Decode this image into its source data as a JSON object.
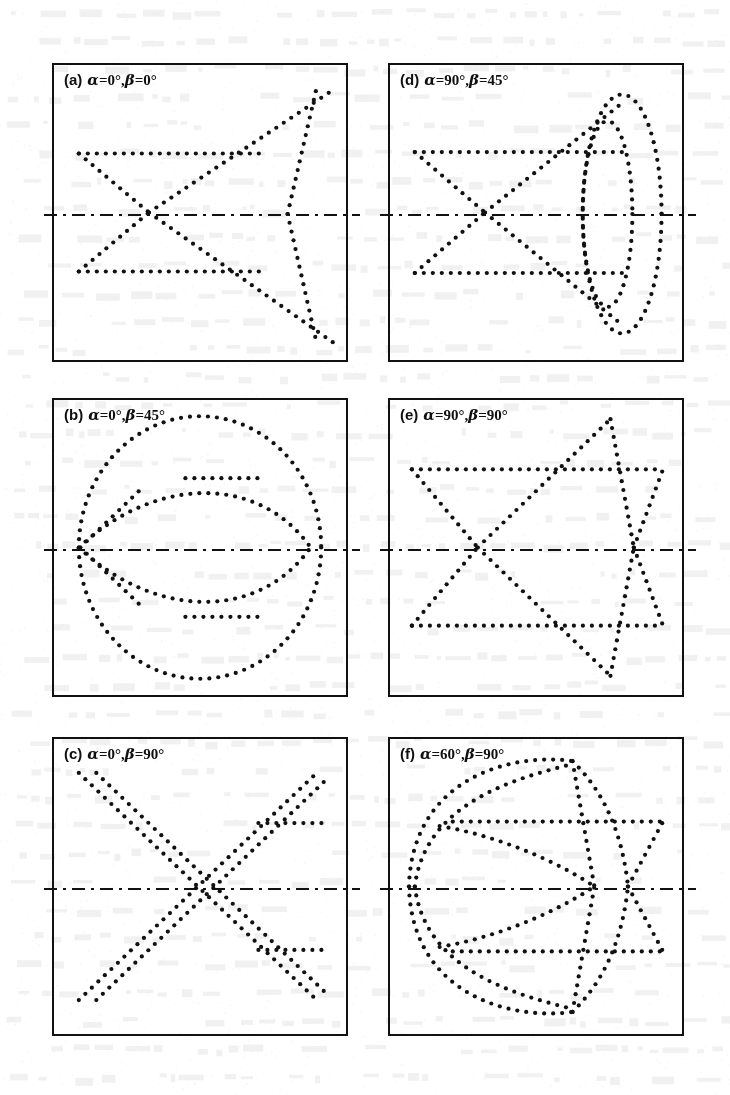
{
  "figure": {
    "kind": "six-panel-dot-pattern-figure",
    "panel_count": 6,
    "background_note": "faint bleed-through of printed text from the reverse of the scanned page",
    "ink_color": "#111111",
    "paper_color": "#ffffff",
    "dot_color": "#111111",
    "dot_diameter_px": 4.2,
    "dot_spacing_px": 9,
    "centerline_style": "dash-dot",
    "layout": {
      "columns": 2,
      "rows": 3,
      "panel_width_px": 296,
      "panel_height_px": 299,
      "col_x_px": [
        52,
        388
      ],
      "row_y_px": [
        63,
        398,
        737
      ]
    }
  },
  "panels": [
    {
      "id": "a",
      "tag": "(a)",
      "alpha": "0°",
      "beta": "0°",
      "params_text": "α=0°,β=0°",
      "centerline_y_frac": 0.5,
      "chart_data": {
        "type": "scatter",
        "title": "(a) α=0°, β=0°",
        "xlim": [
          0,
          1
        ],
        "ylim": [
          0,
          1
        ],
        "grid": false,
        "legend": null,
        "strokes": [
          {
            "name": "upper-horizontal",
            "kind": "line",
            "points": [
              [
                0.085,
                0.3
              ],
              [
                0.72,
                0.3
              ]
            ]
          },
          {
            "name": "lower-horizontal",
            "kind": "line",
            "points": [
              [
                0.085,
                0.7
              ],
              [
                0.72,
                0.7
              ]
            ]
          },
          {
            "name": "upper-left-diagonal-down",
            "kind": "line",
            "points": [
              [
                0.085,
                0.3
              ],
              [
                0.325,
                0.5
              ]
            ]
          },
          {
            "name": "lower-left-diagonal-up",
            "kind": "line",
            "points": [
              [
                0.085,
                0.7
              ],
              [
                0.325,
                0.5
              ]
            ]
          },
          {
            "name": "left-node-to-upper-right",
            "kind": "line",
            "points": [
              [
                0.325,
                0.5
              ],
              [
                0.955,
                0.085
              ]
            ]
          },
          {
            "name": "left-node-to-lower-right",
            "kind": "line",
            "points": [
              [
                0.325,
                0.5
              ],
              [
                0.955,
                0.94
              ]
            ]
          },
          {
            "name": "right-node-steep-up",
            "kind": "line",
            "points": [
              [
                0.8,
                0.505
              ],
              [
                0.9,
                0.075
              ]
            ]
          },
          {
            "name": "right-node-steep-down",
            "kind": "line",
            "points": [
              [
                0.8,
                0.505
              ],
              [
                0.9,
                0.945
              ]
            ]
          }
        ]
      }
    },
    {
      "id": "b",
      "tag": "(b)",
      "alpha": "0°",
      "beta": "45°",
      "params_text": "α=0°,β=45°",
      "centerline_y_frac": 0.5,
      "chart_data": {
        "type": "scatter",
        "title": "(b) α=0°, β=45°",
        "xlim": [
          0,
          1
        ],
        "ylim": [
          0,
          1
        ],
        "grid": false,
        "legend": null,
        "strokes": [
          {
            "name": "outer-circle",
            "kind": "ellipse",
            "cx": 0.5,
            "cy": 0.5,
            "rx": 0.415,
            "ry": 0.445,
            "a0": 0,
            "a1": 360
          },
          {
            "name": "inner-lens-upper",
            "kind": "arc-bezier",
            "points": [
              [
                0.085,
                0.5
              ],
              [
                0.35,
                0.255
              ],
              [
                0.7,
                0.255
              ],
              [
                0.875,
                0.495
              ]
            ]
          },
          {
            "name": "inner-lens-lower",
            "kind": "arc-bezier",
            "points": [
              [
                0.085,
                0.5
              ],
              [
                0.35,
                0.745
              ],
              [
                0.7,
                0.745
              ],
              [
                0.875,
                0.505
              ]
            ]
          },
          {
            "name": "inner-horizontal-upper",
            "kind": "line",
            "points": [
              [
                0.45,
                0.265
              ],
              [
                0.7,
                0.265
              ]
            ]
          },
          {
            "name": "inner-horizontal-lower",
            "kind": "line",
            "points": [
              [
                0.45,
                0.735
              ],
              [
                0.7,
                0.735
              ]
            ]
          },
          {
            "name": "left-spur-upper",
            "kind": "line",
            "points": [
              [
                0.09,
                0.5
              ],
              [
                0.3,
                0.3
              ]
            ]
          },
          {
            "name": "left-spur-lower",
            "kind": "line",
            "points": [
              [
                0.09,
                0.5
              ],
              [
                0.3,
                0.7
              ]
            ]
          }
        ]
      }
    },
    {
      "id": "c",
      "tag": "(c)",
      "alpha": "0°",
      "beta": "90°",
      "params_text": "α=0°,β=90°",
      "centerline_y_frac": 0.5,
      "chart_data": {
        "type": "scatter",
        "title": "(c) α=0°, β=90°",
        "xlim": [
          0,
          1
        ],
        "ylim": [
          0,
          1
        ],
        "grid": false,
        "legend": null,
        "strokes": [
          {
            "name": "main-diagonal-nw-to-se",
            "kind": "line",
            "points": [
              [
                0.085,
                0.115
              ],
              [
                0.9,
                0.885
              ]
            ]
          },
          {
            "name": "main-diagonal-sw-to-ne",
            "kind": "line",
            "points": [
              [
                0.085,
                0.885
              ],
              [
                0.9,
                0.115
              ]
            ]
          },
          {
            "name": "second-diagonal-nw-to-se",
            "kind": "line",
            "points": [
              [
                0.145,
                0.115
              ],
              [
                0.93,
                0.86
              ]
            ]
          },
          {
            "name": "second-diagonal-sw-to-ne",
            "kind": "line",
            "points": [
              [
                0.145,
                0.885
              ],
              [
                0.93,
                0.14
              ]
            ]
          },
          {
            "name": "right-horizontal-upper",
            "kind": "line",
            "points": [
              [
                0.7,
                0.285
              ],
              [
                0.93,
                0.285
              ]
            ]
          },
          {
            "name": "right-horizontal-lower",
            "kind": "line",
            "points": [
              [
                0.7,
                0.715
              ],
              [
                0.93,
                0.715
              ]
            ]
          }
        ]
      }
    },
    {
      "id": "d",
      "tag": "(d)",
      "alpha": "90°",
      "beta": "45°",
      "params_text": "α=90°,β=45°",
      "centerline_y_frac": 0.5,
      "chart_data": {
        "type": "scatter",
        "title": "(d) α=90°, β=45°",
        "xlim": [
          0,
          1
        ],
        "ylim": [
          0,
          1
        ],
        "grid": false,
        "legend": null,
        "strokes": [
          {
            "name": "upper-horizontal",
            "kind": "line",
            "points": [
              [
                0.085,
                0.295
              ],
              [
                0.82,
                0.295
              ]
            ]
          },
          {
            "name": "lower-horizontal",
            "kind": "line",
            "points": [
              [
                0.085,
                0.705
              ],
              [
                0.82,
                0.705
              ]
            ]
          },
          {
            "name": "upper-left-diagonal-down",
            "kind": "line",
            "points": [
              [
                0.085,
                0.295
              ],
              [
                0.325,
                0.5
              ]
            ]
          },
          {
            "name": "lower-left-diagonal-up",
            "kind": "line",
            "points": [
              [
                0.085,
                0.705
              ],
              [
                0.325,
                0.5
              ]
            ]
          },
          {
            "name": "left-node-to-upper-right",
            "kind": "line",
            "points": [
              [
                0.325,
                0.5
              ],
              [
                0.8,
                0.125
              ]
            ]
          },
          {
            "name": "left-node-to-lower-right",
            "kind": "line",
            "points": [
              [
                0.325,
                0.5
              ],
              [
                0.8,
                0.885
              ]
            ]
          },
          {
            "name": "outer-ellipse",
            "kind": "ellipse",
            "cx": 0.795,
            "cy": 0.505,
            "rx": 0.135,
            "ry": 0.405,
            "a0": 0,
            "a1": 360
          },
          {
            "name": "inner-ellipse",
            "kind": "ellipse",
            "cx": 0.745,
            "cy": 0.505,
            "rx": 0.085,
            "ry": 0.315,
            "a0": 0,
            "a1": 360
          }
        ]
      }
    },
    {
      "id": "e",
      "tag": "(e)",
      "alpha": "90°",
      "beta": "90°",
      "params_text": "α=90°,β=90°",
      "centerline_y_frac": 0.5,
      "chart_data": {
        "type": "scatter",
        "title": "(e) α=90°, β=90°",
        "xlim": [
          0,
          1
        ],
        "ylim": [
          0,
          1
        ],
        "grid": false,
        "legend": null,
        "strokes": [
          {
            "name": "upper-horizontal",
            "kind": "line",
            "points": [
              [
                0.075,
                0.235
              ],
              [
                0.935,
                0.235
              ]
            ]
          },
          {
            "name": "lower-horizontal",
            "kind": "line",
            "points": [
              [
                0.075,
                0.765
              ],
              [
                0.935,
                0.765
              ]
            ]
          },
          {
            "name": "upper-left-diagonal-down",
            "kind": "line",
            "points": [
              [
                0.075,
                0.235
              ],
              [
                0.3,
                0.5
              ]
            ]
          },
          {
            "name": "lower-left-diagonal-up",
            "kind": "line",
            "points": [
              [
                0.075,
                0.765
              ],
              [
                0.3,
                0.5
              ]
            ]
          },
          {
            "name": "left-node-to-upper-apex",
            "kind": "line",
            "points": [
              [
                0.3,
                0.5
              ],
              [
                0.755,
                0.065
              ]
            ]
          },
          {
            "name": "left-node-to-lower-apex",
            "kind": "line",
            "points": [
              [
                0.3,
                0.5
              ],
              [
                0.755,
                0.935
              ]
            ]
          },
          {
            "name": "upper-apex-to-right-node",
            "kind": "line",
            "points": [
              [
                0.755,
                0.065
              ],
              [
                0.835,
                0.5
              ]
            ]
          },
          {
            "name": "lower-apex-to-right-node",
            "kind": "line",
            "points": [
              [
                0.755,
                0.935
              ],
              [
                0.835,
                0.5
              ]
            ]
          },
          {
            "name": "right-node-to-upper-right",
            "kind": "line",
            "points": [
              [
                0.835,
                0.5
              ],
              [
                0.935,
                0.235
              ]
            ]
          },
          {
            "name": "right-node-to-lower-right",
            "kind": "line",
            "points": [
              [
                0.835,
                0.5
              ],
              [
                0.935,
                0.765
              ]
            ]
          }
        ]
      }
    },
    {
      "id": "f",
      "tag": "(f)",
      "alpha": "60°",
      "beta": "90°",
      "params_text": "α=60°,β=90°",
      "centerline_y_frac": 0.5,
      "chart_data": {
        "type": "scatter",
        "title": "(f) α=60°, β=90°",
        "xlim": [
          0,
          1
        ],
        "ylim": [
          0,
          1
        ],
        "grid": false,
        "legend": null,
        "strokes": [
          {
            "name": "upper-horizontal",
            "kind": "line",
            "points": [
              [
                0.215,
                0.28
              ],
              [
                0.935,
                0.28
              ]
            ]
          },
          {
            "name": "lower-horizontal",
            "kind": "line",
            "points": [
              [
                0.215,
                0.72
              ],
              [
                0.935,
                0.72
              ]
            ]
          },
          {
            "name": "outer-arc-upper",
            "kind": "arc-bezier",
            "points": [
              [
                0.065,
                0.5
              ],
              [
                0.075,
                0.13
              ],
              [
                0.42,
                0.045
              ],
              [
                0.625,
                0.075
              ]
            ]
          },
          {
            "name": "outer-arc-lower",
            "kind": "arc-bezier",
            "points": [
              [
                0.065,
                0.5
              ],
              [
                0.075,
                0.87
              ],
              [
                0.42,
                0.955
              ],
              [
                0.625,
                0.925
              ]
            ]
          },
          {
            "name": "inner-arc-upper",
            "kind": "arc-bezier",
            "points": [
              [
                0.085,
                0.5
              ],
              [
                0.12,
                0.22
              ],
              [
                0.42,
                0.135
              ],
              [
                0.625,
                0.085
              ]
            ]
          },
          {
            "name": "inner-arc-lower",
            "kind": "arc-bezier",
            "points": [
              [
                0.085,
                0.5
              ],
              [
                0.12,
                0.78
              ],
              [
                0.42,
                0.865
              ],
              [
                0.625,
                0.915
              ]
            ]
          },
          {
            "name": "right-arc-upper",
            "kind": "arc-bezier",
            "points": [
              [
                0.625,
                0.075
              ],
              [
                0.755,
                0.2
              ],
              [
                0.8,
                0.36
              ],
              [
                0.815,
                0.5
              ]
            ]
          },
          {
            "name": "right-arc-lower",
            "kind": "arc-bezier",
            "points": [
              [
                0.625,
                0.925
              ],
              [
                0.755,
                0.8
              ],
              [
                0.8,
                0.64
              ],
              [
                0.815,
                0.5
              ]
            ]
          },
          {
            "name": "mid-chord-upper",
            "kind": "arc-bezier",
            "points": [
              [
                0.17,
                0.295
              ],
              [
                0.38,
                0.33
              ],
              [
                0.58,
                0.42
              ],
              [
                0.7,
                0.5
              ]
            ]
          },
          {
            "name": "mid-chord-lower",
            "kind": "arc-bezier",
            "points": [
              [
                0.17,
                0.705
              ],
              [
                0.38,
                0.67
              ],
              [
                0.58,
                0.58
              ],
              [
                0.7,
                0.5
              ]
            ]
          },
          {
            "name": "right-node-to-upper-right",
            "kind": "line",
            "points": [
              [
                0.815,
                0.5
              ],
              [
                0.935,
                0.28
              ]
            ]
          },
          {
            "name": "right-node-to-lower-right",
            "kind": "line",
            "points": [
              [
                0.815,
                0.5
              ],
              [
                0.935,
                0.72
              ]
            ]
          },
          {
            "name": "crossing-upper-to-node",
            "kind": "line",
            "points": [
              [
                0.625,
                0.075
              ],
              [
                0.7,
                0.5
              ]
            ]
          },
          {
            "name": "crossing-lower-to-node",
            "kind": "line",
            "points": [
              [
                0.625,
                0.925
              ],
              [
                0.7,
                0.5
              ]
            ]
          }
        ]
      }
    }
  ]
}
